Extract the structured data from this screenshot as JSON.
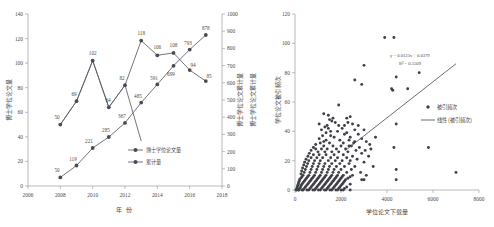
{
  "figure": {
    "panels": [
      "left-line-chart",
      "right-scatter-chart"
    ]
  },
  "chart_data": [
    {
      "type": "line",
      "id": "doctoral-dissertation-trend",
      "title": "",
      "xlabel": "年 份",
      "ylabel": "博士学位论文量",
      "y2label": "博士学位论文累计量",
      "xlim": [
        2006,
        2018
      ],
      "ylim": [
        0,
        140
      ],
      "y2lim": [
        0,
        1000
      ],
      "xticks": [
        "2006",
        "2008",
        "2010",
        "2012",
        "2014",
        "2016",
        "2018"
      ],
      "yticks": [
        "0",
        "20",
        "40",
        "60",
        "80",
        "100",
        "120",
        "140"
      ],
      "y2ticks": [
        "0",
        "100",
        "200",
        "300",
        "400",
        "500",
        "600",
        "700",
        "800",
        "900",
        "1000"
      ],
      "grid": false,
      "legend_position": "inside-lower-right",
      "x": [
        2008,
        2009,
        2010,
        2011,
        2012,
        2013,
        2014,
        2015,
        2016,
        2017
      ],
      "series": [
        {
          "name": "博士学位论文量",
          "axis": "left",
          "values": [
            50,
            69,
            102,
            64,
            82,
            118,
            106,
            108,
            94,
            85
          ],
          "labels": [
            "50",
            "69",
            "102",
            "64",
            "82",
            "118",
            "106",
            "108",
            "94",
            "85"
          ]
        },
        {
          "name": "累计量",
          "axis": "right",
          "values": [
            50,
            119,
            221,
            285,
            367,
            485,
            591,
            699,
            793,
            878
          ],
          "labels": [
            "50",
            "119",
            "221",
            "285",
            "367",
            "485",
            "591",
            "699",
            "793",
            "878"
          ]
        }
      ]
    },
    {
      "type": "scatter",
      "id": "downloads-vs-citations",
      "title": "",
      "xlabel": "学位论文下载量",
      "ylabel": "学位论文被引频次",
      "outer_ylabel": "博士学位论文累计量",
      "xlim": [
        0,
        8000
      ],
      "ylim": [
        0,
        120
      ],
      "xticks": [
        "0",
        "2000",
        "4000",
        "6000",
        "8000"
      ],
      "yticks": [
        "0",
        "20",
        "40",
        "60",
        "80",
        "100",
        "120"
      ],
      "grid": false,
      "legend_position": "inside-right",
      "legend": [
        {
          "name": "被引频次",
          "marker": "dot"
        },
        {
          "name": "线性 (被引频次)",
          "marker": "line"
        }
      ],
      "annotation": {
        "equation": "y = 0.0123x + 0.0379",
        "r_squared": "R² = 0.5509",
        "slope": 0.0123,
        "intercept": 0.0379
      },
      "trendline": {
        "x": [
          2200,
          7000
        ],
        "y": [
          27.1,
          86.1
        ]
      },
      "points": [
        [
          3900,
          104
        ],
        [
          4300,
          104
        ],
        [
          3000,
          85
        ],
        [
          5400,
          80
        ],
        [
          2600,
          75
        ],
        [
          4400,
          77
        ],
        [
          2900,
          72
        ],
        [
          4200,
          69
        ],
        [
          4250,
          68
        ],
        [
          4900,
          69
        ],
        [
          1900,
          58
        ],
        [
          2400,
          50
        ],
        [
          1500,
          48
        ],
        [
          1600,
          47
        ],
        [
          1750,
          46
        ],
        [
          2300,
          46
        ],
        [
          2500,
          45
        ],
        [
          1400,
          44
        ],
        [
          2150,
          44
        ],
        [
          1300,
          43
        ],
        [
          1450,
          42
        ],
        [
          2050,
          42
        ],
        [
          2600,
          41
        ],
        [
          3000,
          41
        ],
        [
          1550,
          40
        ],
        [
          1850,
          40
        ],
        [
          2250,
          39
        ],
        [
          2750,
          38
        ],
        [
          1200,
          37
        ],
        [
          1700,
          36
        ],
        [
          2400,
          36
        ],
        [
          2900,
          35
        ],
        [
          1350,
          34
        ],
        [
          1950,
          34
        ],
        [
          2350,
          34
        ],
        [
          3100,
          33
        ],
        [
          1100,
          32
        ],
        [
          1500,
          32
        ],
        [
          2100,
          32
        ],
        [
          2550,
          32
        ],
        [
          3250,
          31
        ],
        [
          1250,
          30
        ],
        [
          1650,
          30
        ],
        [
          2000,
          30
        ],
        [
          2450,
          30
        ],
        [
          2800,
          29
        ],
        [
          4300,
          29
        ],
        [
          5800,
          29
        ],
        [
          900,
          28
        ],
        [
          1150,
          28
        ],
        [
          1400,
          28
        ],
        [
          1800,
          28
        ],
        [
          2200,
          28
        ],
        [
          2650,
          27
        ],
        [
          3050,
          27
        ],
        [
          1000,
          26
        ],
        [
          1300,
          26
        ],
        [
          1600,
          26
        ],
        [
          1900,
          26
        ],
        [
          2300,
          26
        ],
        [
          2900,
          25
        ],
        [
          800,
          24
        ],
        [
          1050,
          24
        ],
        [
          1350,
          24
        ],
        [
          1700,
          24
        ],
        [
          2100,
          24
        ],
        [
          2500,
          23
        ],
        [
          3200,
          23
        ],
        [
          700,
          22
        ],
        [
          950,
          22
        ],
        [
          1200,
          22
        ],
        [
          1550,
          22
        ],
        [
          1850,
          22
        ],
        [
          2250,
          22
        ],
        [
          2700,
          21
        ],
        [
          4400,
          45
        ],
        [
          600,
          20
        ],
        [
          850,
          20
        ],
        [
          1100,
          20
        ],
        [
          1450,
          20
        ],
        [
          1750,
          20
        ],
        [
          2050,
          20
        ],
        [
          2400,
          20
        ],
        [
          3000,
          19
        ],
        [
          550,
          18
        ],
        [
          800,
          18
        ],
        [
          1050,
          18
        ],
        [
          1300,
          18
        ],
        [
          1600,
          18
        ],
        [
          1950,
          18
        ],
        [
          2350,
          18
        ],
        [
          500,
          16
        ],
        [
          750,
          16
        ],
        [
          1000,
          16
        ],
        [
          1250,
          16
        ],
        [
          1500,
          16
        ],
        [
          1800,
          16
        ],
        [
          2150,
          16
        ],
        [
          2600,
          16
        ],
        [
          3400,
          16
        ],
        [
          450,
          14
        ],
        [
          700,
          14
        ],
        [
          950,
          14
        ],
        [
          1200,
          14
        ],
        [
          1450,
          14
        ],
        [
          1700,
          14
        ],
        [
          2000,
          14
        ],
        [
          2450,
          14
        ],
        [
          4400,
          14
        ],
        [
          7000,
          12
        ],
        [
          400,
          12
        ],
        [
          650,
          12
        ],
        [
          900,
          12
        ],
        [
          1150,
          12
        ],
        [
          1400,
          12
        ],
        [
          1650,
          12
        ],
        [
          1900,
          12
        ],
        [
          2250,
          12
        ],
        [
          2850,
          12
        ],
        [
          350,
          10
        ],
        [
          600,
          10
        ],
        [
          850,
          10
        ],
        [
          1100,
          10
        ],
        [
          1350,
          10
        ],
        [
          1600,
          10
        ],
        [
          1850,
          10
        ],
        [
          2100,
          10
        ],
        [
          2500,
          10
        ],
        [
          3100,
          10
        ],
        [
          300,
          9
        ],
        [
          550,
          9
        ],
        [
          800,
          9
        ],
        [
          1050,
          9
        ],
        [
          1300,
          9
        ],
        [
          1550,
          9
        ],
        [
          1800,
          9
        ],
        [
          2050,
          9
        ],
        [
          2400,
          9
        ],
        [
          250,
          8
        ],
        [
          500,
          8
        ],
        [
          750,
          8
        ],
        [
          1000,
          8
        ],
        [
          1250,
          8
        ],
        [
          1500,
          8
        ],
        [
          1750,
          8
        ],
        [
          2000,
          8
        ],
        [
          2300,
          8
        ],
        [
          2900,
          7
        ],
        [
          4400,
          7
        ],
        [
          200,
          7
        ],
        [
          450,
          7
        ],
        [
          700,
          7
        ],
        [
          950,
          7
        ],
        [
          1200,
          7
        ],
        [
          1450,
          7
        ],
        [
          1700,
          7
        ],
        [
          1950,
          7
        ],
        [
          2200,
          7
        ],
        [
          3000,
          7
        ],
        [
          180,
          6
        ],
        [
          400,
          6
        ],
        [
          650,
          6
        ],
        [
          900,
          6
        ],
        [
          1150,
          6
        ],
        [
          1400,
          6
        ],
        [
          1650,
          6
        ],
        [
          1900,
          6
        ],
        [
          2150,
          6
        ],
        [
          160,
          5
        ],
        [
          350,
          5
        ],
        [
          600,
          5
        ],
        [
          850,
          5
        ],
        [
          1100,
          5
        ],
        [
          1350,
          5
        ],
        [
          1600,
          5
        ],
        [
          1850,
          5
        ],
        [
          2100,
          5
        ],
        [
          140,
          4
        ],
        [
          300,
          4
        ],
        [
          550,
          4
        ],
        [
          800,
          4
        ],
        [
          1050,
          4
        ],
        [
          1300,
          4
        ],
        [
          1550,
          4
        ],
        [
          1800,
          4
        ],
        [
          2050,
          4
        ],
        [
          2400,
          4
        ],
        [
          120,
          3
        ],
        [
          270,
          3
        ],
        [
          500,
          3
        ],
        [
          750,
          3
        ],
        [
          1000,
          3
        ],
        [
          1250,
          3
        ],
        [
          1500,
          3
        ],
        [
          1750,
          3
        ],
        [
          2000,
          3
        ],
        [
          100,
          2
        ],
        [
          240,
          2
        ],
        [
          450,
          2
        ],
        [
          700,
          2
        ],
        [
          950,
          2
        ],
        [
          1200,
          2
        ],
        [
          1450,
          2
        ],
        [
          1700,
          2
        ],
        [
          1950,
          2
        ],
        [
          2250,
          2
        ],
        [
          80,
          1
        ],
        [
          200,
          1
        ],
        [
          400,
          1
        ],
        [
          650,
          1
        ],
        [
          900,
          1
        ],
        [
          1150,
          1
        ],
        [
          1400,
          1
        ],
        [
          1650,
          1
        ],
        [
          1900,
          1
        ],
        [
          2150,
          1
        ],
        [
          60,
          0
        ],
        [
          170,
          0
        ],
        [
          350,
          0
        ],
        [
          600,
          0
        ],
        [
          850,
          0
        ],
        [
          1100,
          0
        ],
        [
          1350,
          0
        ],
        [
          1600,
          0
        ],
        [
          1850,
          0
        ],
        [
          2100,
          0
        ],
        [
          2400,
          0
        ],
        [
          40,
          0
        ],
        [
          140,
          0
        ],
        [
          300,
          0
        ],
        [
          520,
          0
        ],
        [
          780,
          0
        ],
        [
          1020,
          0
        ],
        [
          1280,
          0
        ],
        [
          1520,
          0
        ],
        [
          1780,
          0
        ],
        [
          2000,
          0
        ],
        [
          1250,
          52
        ],
        [
          1450,
          51
        ],
        [
          1650,
          49
        ],
        [
          1900,
          44
        ],
        [
          2150,
          38
        ],
        [
          2350,
          30
        ],
        [
          2600,
          33
        ],
        [
          3300,
          28
        ],
        [
          3500,
          36
        ],
        [
          2750,
          44
        ],
        [
          2250,
          49
        ],
        [
          1050,
          45
        ],
        [
          1150,
          41
        ],
        [
          1350,
          39
        ],
        [
          1550,
          37
        ],
        [
          1050,
          35
        ],
        [
          1250,
          33
        ],
        [
          900,
          31
        ],
        [
          800,
          29
        ],
        [
          700,
          27
        ],
        [
          620,
          25
        ],
        [
          560,
          23
        ],
        [
          480,
          21
        ],
        [
          420,
          19
        ],
        [
          380,
          17
        ],
        [
          330,
          15
        ],
        [
          290,
          13
        ],
        [
          260,
          11
        ]
      ]
    }
  ]
}
